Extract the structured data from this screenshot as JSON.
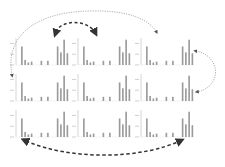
{
  "diagram": {
    "grid": {
      "rows": 3,
      "cols": 3
    },
    "colors": {
      "bars": "#9a9a9a",
      "axis": "#b8b8b8",
      "arrow_dark": "#333333",
      "arrow_light": "#9a9a9a"
    },
    "panels": [
      {
        "row": 0,
        "col": 0
      },
      {
        "row": 0,
        "col": 1
      },
      {
        "row": 0,
        "col": 2
      },
      {
        "row": 1,
        "col": 0
      },
      {
        "row": 1,
        "col": 1
      },
      {
        "row": 1,
        "col": 2
      },
      {
        "row": 2,
        "col": 0
      },
      {
        "row": 2,
        "col": 1
      },
      {
        "row": 2,
        "col": 2
      }
    ],
    "arrows": [
      {
        "id": "top-dashed-swap",
        "style": "dashed",
        "color": "dark",
        "from": "panel 0,0",
        "to": "panel 0,1",
        "bidirectional": true
      },
      {
        "id": "top-dotted-arc",
        "style": "dotted",
        "color": "light",
        "from": "panel 1,0",
        "to": "panel 0,2",
        "bidirectional": true
      },
      {
        "id": "right-dotted-arc",
        "style": "dotted",
        "color": "light",
        "from": "panel 0,2",
        "to": "panel 1,2",
        "bidirectional": true
      },
      {
        "id": "bottom-dashed-arc",
        "style": "dashed",
        "color": "dark",
        "from": "panel 2,0",
        "to": "panel 2,2",
        "bidirectional": true
      }
    ]
  },
  "chart_data": {
    "type": "bar",
    "title": "",
    "xlabel": "",
    "ylabel": "",
    "note": "Each of the 9 panels shows the same small bar chart layout; tick labels are unreadable at this resolution",
    "categories": [
      "1",
      "2",
      "3",
      "4",
      "5",
      "6",
      "7",
      "8",
      "9",
      "10",
      "11",
      "12",
      "13",
      "14",
      "15",
      "16"
    ],
    "values": [
      0,
      22,
      6,
      3,
      4,
      0,
      0,
      5,
      0,
      5,
      0,
      0,
      22,
      15,
      30,
      14
    ],
    "ylim": [
      0,
      32
    ],
    "grid": false,
    "legend": null
  }
}
